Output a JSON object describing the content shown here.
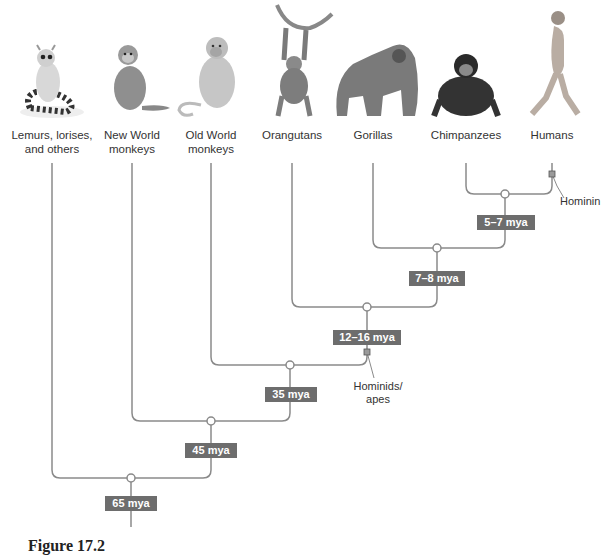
{
  "taxa": [
    {
      "name": "Lemurs, lorises, and others",
      "line1": "Lemurs, lorises,",
      "line2": "and others",
      "icon": "lemur-illustration",
      "x": 52
    },
    {
      "name": "New World monkeys",
      "line1": "New World",
      "line2": "monkeys",
      "icon": "new-world-monkey-illustration",
      "x": 132
    },
    {
      "name": "Old World monkeys",
      "line1": "Old World",
      "line2": "monkeys",
      "icon": "old-world-monkey-illustration",
      "x": 211
    },
    {
      "name": "Orangutans",
      "line1": "Orangutans",
      "line2": "",
      "icon": "orangutan-illustration",
      "x": 292
    },
    {
      "name": "Gorillas",
      "line1": "Gorillas",
      "line2": "",
      "icon": "gorilla-illustration",
      "x": 373
    },
    {
      "name": "Chimpanzees",
      "line1": "Chimpanzees",
      "line2": "",
      "icon": "chimpanzee-illustration",
      "x": 466
    },
    {
      "name": "Humans",
      "line1": "Humans",
      "line2": "",
      "icon": "human-illustration",
      "x": 552
    }
  ],
  "divergences": [
    {
      "label": "5–7 mya",
      "between": [
        "Chimpanzees",
        "Humans"
      ]
    },
    {
      "label": "7–8 mya",
      "between": [
        "Gorillas",
        "Chimpanzees+Humans"
      ]
    },
    {
      "label": "12–16 mya",
      "between": [
        "Orangutans",
        "African apes"
      ]
    },
    {
      "label": "35 mya",
      "between": [
        "Old World monkeys",
        "Apes"
      ]
    },
    {
      "label": "45 mya",
      "between": [
        "New World monkeys",
        "Old World monkeys+Apes"
      ]
    },
    {
      "label": "65 mya",
      "between": [
        "Lemurs, lorises, and others",
        "Anthropoids"
      ]
    }
  ],
  "annotations": {
    "hominin": "Hominin",
    "hominids_line1": "Hominids/",
    "hominids_line2": "apes"
  },
  "colors": {
    "line": "#8a8a8a",
    "label_box": "#6d6d6d",
    "label_text": "#ffffff"
  },
  "caption": "Figure 17.2"
}
